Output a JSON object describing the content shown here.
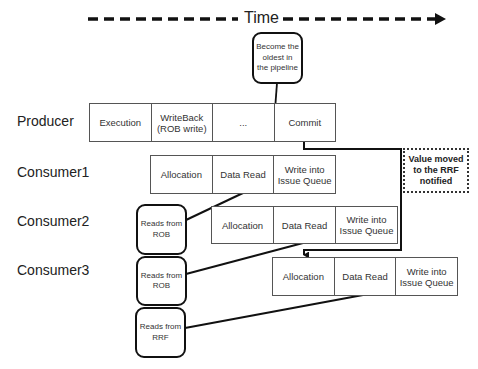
{
  "timeline": {
    "label": "Time"
  },
  "milestone_note": "Become the oldest in the pipeline",
  "rrf_note": "Value moved to the RRF notified",
  "rows": [
    {
      "label": "Producer",
      "stages": [
        "Execution",
        "WriteBack (ROB write)",
        "...",
        "Commit"
      ]
    },
    {
      "label": "Consumer1",
      "stages": [
        "Allocation",
        "Data Read",
        "Write into Issue Queue"
      ]
    },
    {
      "label": "Consumer2",
      "stages": [
        "Allocation",
        "Data Read",
        "Write into Issue Queue"
      ]
    },
    {
      "label": "Consumer3",
      "stages": [
        "Allocation",
        "Data Read",
        "Write into Issue Queue"
      ]
    }
  ],
  "sources": [
    {
      "label": "Reads from ROB"
    },
    {
      "label": "Reads from ROB"
    },
    {
      "label": "Reads from RRF"
    }
  ]
}
